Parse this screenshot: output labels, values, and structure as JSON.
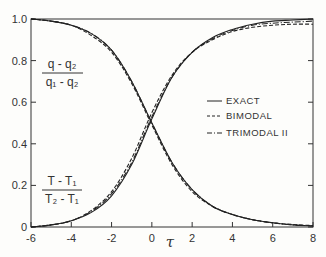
{
  "chart_data": {
    "type": "line",
    "title": "",
    "xlabel": "τ",
    "ylabel": "",
    "xlim": [
      -6,
      8
    ],
    "ylim": [
      0,
      1.0
    ],
    "grid": false,
    "legend_position": "right-middle",
    "x_ticks": [
      -6,
      -4,
      -2,
      0,
      2,
      4,
      6,
      8
    ],
    "x_tick_labels": [
      "-6",
      "-4",
      "-2",
      "0",
      "2",
      "4",
      "6",
      "8"
    ],
    "y_ticks": [
      0,
      0.2,
      0.4,
      0.6,
      0.8,
      1.0
    ],
    "y_tick_labels": [
      "0",
      "0.2",
      "0.4",
      "0.6",
      "0.8",
      "1.0"
    ],
    "annotations": [
      {
        "text": "(q - q2)/(q1 - q2)",
        "numerator": "q - q₂",
        "denominator": "q₁ - q₂",
        "position": "upper-left",
        "refers_to": "decreasing curves"
      },
      {
        "text": "(T - T1)/(T2 - T1)",
        "numerator": "T - T₁",
        "denominator": "T₂ - T₁",
        "position": "lower-left",
        "refers_to": "increasing curves"
      }
    ],
    "legend": [
      {
        "label": "EXACT",
        "style": "solid"
      },
      {
        "label": "BIMODAL",
        "style": "dashed"
      },
      {
        "label": "TRIMODAL II",
        "style": "dash-dot"
      }
    ],
    "x": [
      -6,
      -5,
      -4,
      -3,
      -2,
      -1,
      0,
      1,
      2,
      3,
      4,
      5,
      6,
      7,
      8
    ],
    "series": [
      {
        "name": "EXACT (q - q2)/(q1 - q2)",
        "style": "solid",
        "values": [
          1.0,
          0.99,
          0.97,
          0.93,
          0.85,
          0.7,
          0.5,
          0.31,
          0.18,
          0.1,
          0.06,
          0.035,
          0.02,
          0.01,
          0.005
        ]
      },
      {
        "name": "BIMODAL (q - q2)/(q1 - q2)",
        "style": "dashed",
        "values": [
          1.0,
          0.99,
          0.97,
          0.92,
          0.84,
          0.69,
          0.49,
          0.3,
          0.17,
          0.1,
          0.06,
          0.035,
          0.02,
          0.012,
          0.007
        ]
      },
      {
        "name": "TRIMODAL II (q - q2)/(q1 - q2)",
        "style": "dash-dot",
        "values": [
          1.0,
          0.99,
          0.97,
          0.93,
          0.85,
          0.7,
          0.5,
          0.31,
          0.18,
          0.1,
          0.06,
          0.035,
          0.02,
          0.01,
          0.006
        ]
      },
      {
        "name": "EXACT (T - T1)/(T2 - T1)",
        "style": "solid",
        "values": [
          0.0,
          0.01,
          0.03,
          0.07,
          0.15,
          0.3,
          0.52,
          0.72,
          0.84,
          0.91,
          0.95,
          0.975,
          0.99,
          0.995,
          1.0
        ]
      },
      {
        "name": "BIMODAL (T - T1)/(T2 - T1)",
        "style": "dashed",
        "values": [
          0.0,
          0.01,
          0.03,
          0.08,
          0.17,
          0.33,
          0.55,
          0.73,
          0.84,
          0.9,
          0.94,
          0.96,
          0.97,
          0.975,
          0.975
        ]
      },
      {
        "name": "TRIMODAL II (T - T1)/(T2 - T1)",
        "style": "dash-dot",
        "values": [
          0.0,
          0.01,
          0.03,
          0.075,
          0.16,
          0.31,
          0.53,
          0.72,
          0.84,
          0.905,
          0.945,
          0.97,
          0.98,
          0.985,
          0.99
        ]
      }
    ]
  },
  "labels": {
    "x_axis": "τ",
    "q_num": "q - q₂",
    "q_den": "q₁ - q₂",
    "t_num": "T - T₁",
    "t_den": "T₂ - T₁",
    "legend_exact": "EXACT",
    "legend_bimodal": "BIMODAL",
    "legend_trimodal": "TRIMODAL II"
  }
}
